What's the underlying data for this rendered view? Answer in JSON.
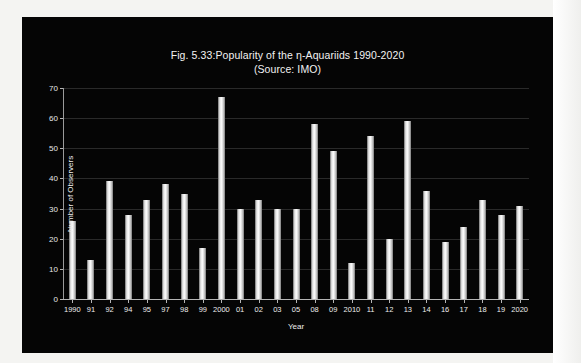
{
  "chart_data": {
    "type": "bar",
    "title": "Fig. 5.33:Popularity of the η-Aquariids 1990-2020",
    "subtitle": "(Source: IMO)",
    "xlabel": "Year",
    "ylabel": "Number of Observers",
    "ylim": [
      0,
      70
    ],
    "yticks": [
      0,
      10,
      20,
      30,
      40,
      50,
      60,
      70
    ],
    "grid": true,
    "legend": "none",
    "categories": [
      "1990",
      "91",
      "92",
      "94",
      "95",
      "97",
      "98",
      "99",
      "2000",
      "01",
      "02",
      "03",
      "05",
      "08",
      "09",
      "2010",
      "11",
      "12",
      "13",
      "14",
      "16",
      "17",
      "18",
      "19",
      "2020"
    ],
    "values": [
      26,
      13,
      39,
      28,
      33,
      38,
      35,
      17,
      67,
      30,
      33,
      30,
      30,
      58,
      49,
      12,
      54,
      20,
      59,
      36,
      19,
      24,
      33,
      28,
      31
    ],
    "bar_color": "#ffffff",
    "background_color": "#050505",
    "text_color": "#f2f2f2"
  }
}
